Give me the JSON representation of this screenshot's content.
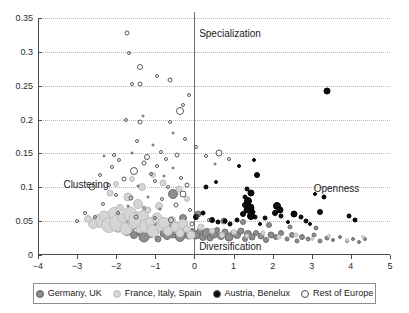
{
  "chart_data": {
    "type": "scatter",
    "title": "",
    "subtitle": "",
    "xlabel": "",
    "ylabel": "",
    "xlim": [
      -4,
      5
    ],
    "ylim": [
      0,
      0.35
    ],
    "grid": "horizontal-dotted",
    "legend_position": "bottom",
    "xticks": [
      "-4",
      "-3",
      "-2",
      "-1",
      "0",
      "1",
      "2",
      "3",
      "4",
      "5"
    ],
    "xtick_values": [
      -4,
      -3,
      -2,
      -1,
      0,
      1,
      2,
      3,
      4,
      5
    ],
    "yticks": [
      "0",
      "0.05",
      "0.1",
      "0.15",
      "0.2",
      "0.25",
      "0.3",
      "0.35"
    ],
    "ytick_values": [
      0,
      0.05,
      0.1,
      0.15,
      0.2,
      0.25,
      0.3,
      0.35
    ],
    "reference_lines": [
      {
        "axis": "x",
        "value": 0
      }
    ],
    "annotations": [
      {
        "text": "Specialization",
        "x": 0.12,
        "y": 0.335,
        "align": "left"
      },
      {
        "text": "Clustering",
        "x": -3.35,
        "y": 0.112,
        "align": "left"
      },
      {
        "text": "Openness",
        "x": 3.05,
        "y": 0.107,
        "align": "left"
      },
      {
        "text": "Diversification",
        "x": 0.12,
        "y": 0.021,
        "align": "left"
      }
    ],
    "legend": [
      {
        "name": "Germany, UK",
        "marker": "filled-circle",
        "color": "#8e8e8e"
      },
      {
        "name": "France, Italy, Spain",
        "marker": "filled-circle",
        "color": "#d5d5d5"
      },
      {
        "name": "Austria, Benelux",
        "marker": "filled-circle",
        "color": "#0d0d0d"
      },
      {
        "name": "Rest of Europe",
        "marker": "open-circle",
        "color": "#ffffff"
      }
    ],
    "series": [
      {
        "name": "Germany, UK",
        "key": "de",
        "color": "#8e8e8e",
        "points": [
          [
            -2.05,
            0.048,
            9
          ],
          [
            -1.95,
            0.041,
            11
          ],
          [
            -1.8,
            0.052,
            7
          ],
          [
            -1.72,
            0.036,
            10
          ],
          [
            -1.62,
            0.044,
            13
          ],
          [
            -1.55,
            0.03,
            8
          ],
          [
            -1.44,
            0.049,
            12
          ],
          [
            -1.36,
            0.034,
            9
          ],
          [
            -1.28,
            0.027,
            11
          ],
          [
            -1.18,
            0.042,
            14
          ],
          [
            -1.1,
            0.031,
            8
          ],
          [
            -1.02,
            0.038,
            10
          ],
          [
            -0.94,
            0.024,
            7
          ],
          [
            -0.86,
            0.045,
            12
          ],
          [
            -0.78,
            0.033,
            9
          ],
          [
            -0.7,
            0.028,
            8
          ],
          [
            -0.62,
            0.04,
            11
          ],
          [
            -0.54,
            0.03,
            7
          ],
          [
            -0.46,
            0.035,
            9
          ],
          [
            -0.38,
            0.026,
            10
          ],
          [
            -0.3,
            0.032,
            8
          ],
          [
            -0.22,
            0.038,
            7
          ],
          [
            -0.14,
            0.029,
            9
          ],
          [
            -0.06,
            0.034,
            8
          ],
          [
            0.05,
            0.03,
            9
          ],
          [
            0.14,
            0.036,
            7
          ],
          [
            0.22,
            0.027,
            8
          ],
          [
            0.31,
            0.033,
            10
          ],
          [
            0.4,
            0.025,
            7
          ],
          [
            0.49,
            0.031,
            9
          ],
          [
            0.58,
            0.037,
            6
          ],
          [
            0.67,
            0.028,
            8
          ],
          [
            0.78,
            0.034,
            7
          ],
          [
            0.88,
            0.026,
            9
          ],
          [
            0.98,
            0.032,
            6
          ],
          [
            1.08,
            0.029,
            8
          ],
          [
            1.18,
            0.035,
            7
          ],
          [
            1.28,
            0.024,
            6
          ],
          [
            1.38,
            0.031,
            8
          ],
          [
            1.48,
            0.027,
            7
          ],
          [
            1.58,
            0.033,
            6
          ],
          [
            1.7,
            0.028,
            7
          ],
          [
            1.82,
            0.022,
            6
          ],
          [
            1.95,
            0.03,
            7
          ],
          [
            2.08,
            0.026,
            6
          ],
          [
            2.22,
            0.033,
            6
          ],
          [
            2.36,
            0.024,
            5
          ],
          [
            2.5,
            0.029,
            6
          ],
          [
            2.62,
            0.021,
            5
          ],
          [
            2.76,
            0.027,
            6
          ],
          [
            2.9,
            0.023,
            5
          ],
          [
            3.05,
            0.029,
            5
          ],
          [
            3.2,
            0.02,
            5
          ],
          [
            3.38,
            0.025,
            5
          ],
          [
            3.55,
            0.022,
            4
          ],
          [
            3.72,
            0.027,
            4
          ],
          [
            3.9,
            0.021,
            4
          ],
          [
            4.05,
            0.024,
            4
          ],
          [
            4.2,
            0.019,
            4
          ],
          [
            4.35,
            0.023,
            4
          ],
          [
            -0.55,
            0.09,
            10
          ],
          [
            -0.3,
            0.054,
            8
          ],
          [
            0.1,
            0.061,
            7
          ],
          [
            0.75,
            0.05,
            7
          ],
          [
            1.25,
            0.048,
            6
          ],
          [
            1.9,
            0.045,
            6
          ],
          [
            2.45,
            0.042,
            5
          ],
          [
            3.1,
            0.04,
            5
          ]
        ]
      },
      {
        "name": "France, Italy, Spain",
        "key": "fr",
        "color": "#d5d5d5",
        "points": [
          [
            -2.45,
            0.05,
            14
          ],
          [
            -2.3,
            0.058,
            11
          ],
          [
            -2.18,
            0.044,
            16
          ],
          [
            -2.05,
            0.062,
            12
          ],
          [
            -1.95,
            0.047,
            18
          ],
          [
            -1.86,
            0.055,
            10
          ],
          [
            -1.76,
            0.039,
            13
          ],
          [
            -1.66,
            0.06,
            15
          ],
          [
            -1.58,
            0.046,
            11
          ],
          [
            -1.48,
            0.052,
            17
          ],
          [
            -1.4,
            0.038,
            9
          ],
          [
            -1.32,
            0.057,
            12
          ],
          [
            -1.24,
            0.043,
            14
          ],
          [
            -1.14,
            0.049,
            10
          ],
          [
            -1.06,
            0.035,
            13
          ],
          [
            -0.96,
            0.054,
            11
          ],
          [
            -0.88,
            0.041,
            9
          ],
          [
            -0.78,
            0.047,
            12
          ],
          [
            -0.68,
            0.036,
            10
          ],
          [
            -0.58,
            0.051,
            8
          ],
          [
            -0.48,
            0.042,
            11
          ],
          [
            -0.38,
            0.033,
            9
          ],
          [
            -0.28,
            0.046,
            10
          ],
          [
            -0.18,
            0.038,
            8
          ],
          [
            -0.08,
            0.03,
            9
          ],
          [
            -2.6,
            0.046,
            10
          ],
          [
            -2.72,
            0.053,
            8
          ],
          [
            -1.7,
            0.085,
            9
          ],
          [
            -1.9,
            0.07,
            8
          ],
          [
            -1.45,
            0.076,
            10
          ],
          [
            -1.2,
            0.066,
            7
          ],
          [
            -0.9,
            0.072,
            8
          ],
          [
            -2.15,
            0.092,
            7
          ],
          [
            -1.35,
            0.1,
            8
          ],
          [
            -0.8,
            0.106,
            7
          ],
          [
            -1.05,
            0.118,
            6
          ],
          [
            -1.6,
            0.112,
            6
          ],
          [
            -2.0,
            0.105,
            6
          ],
          [
            -0.4,
            0.097,
            7
          ],
          [
            -0.2,
            0.082,
            6
          ],
          [
            0.18,
            0.042,
            7
          ],
          [
            0.45,
            0.036,
            6
          ],
          [
            0.7,
            0.03,
            6
          ],
          [
            1.0,
            0.034,
            6
          ],
          [
            1.35,
            0.028,
            5
          ],
          [
            1.75,
            0.032,
            5
          ],
          [
            2.15,
            0.026,
            5
          ],
          [
            2.6,
            0.03,
            5
          ],
          [
            3.0,
            0.024,
            4
          ],
          [
            3.45,
            0.028,
            4
          ],
          [
            3.9,
            0.022,
            4
          ],
          [
            4.3,
            0.026,
            4
          ]
        ]
      },
      {
        "name": "Austria, Benelux",
        "key": "at",
        "color": "#0d0d0d",
        "points": [
          [
            3.4,
            0.242,
            7
          ],
          [
            1.6,
            0.118,
            6
          ],
          [
            1.35,
            0.098,
            5
          ],
          [
            1.45,
            0.092,
            7
          ],
          [
            1.3,
            0.086,
            5
          ],
          [
            1.38,
            0.08,
            8
          ],
          [
            1.28,
            0.074,
            6
          ],
          [
            1.42,
            0.07,
            9
          ],
          [
            1.34,
            0.066,
            7
          ],
          [
            1.5,
            0.064,
            5
          ],
          [
            1.24,
            0.06,
            6
          ],
          [
            1.44,
            0.058,
            8
          ],
          [
            1.56,
            0.056,
            5
          ],
          [
            2.1,
            0.072,
            8
          ],
          [
            2.18,
            0.066,
            7
          ],
          [
            2.05,
            0.062,
            6
          ],
          [
            2.22,
            0.058,
            5
          ],
          [
            3.2,
            0.064,
            6
          ],
          [
            3.3,
            0.086,
            5
          ],
          [
            3.08,
            0.09,
            4
          ],
          [
            2.55,
            0.06,
            7
          ],
          [
            2.72,
            0.056,
            5
          ],
          [
            2.86,
            0.05,
            5
          ],
          [
            3.95,
            0.058,
            5
          ],
          [
            4.1,
            0.052,
            5
          ],
          [
            0.45,
            0.052,
            6
          ],
          [
            0.6,
            0.048,
            5
          ],
          [
            0.78,
            0.05,
            5
          ],
          [
            0.92,
            0.046,
            5
          ],
          [
            1.08,
            0.052,
            5
          ],
          [
            1.68,
            0.046,
            4
          ],
          [
            1.8,
            0.055,
            5
          ],
          [
            0.3,
            0.1,
            5
          ],
          [
            0.55,
            0.108,
            4
          ],
          [
            2.4,
            0.048,
            4
          ],
          [
            2.95,
            0.046,
            4
          ],
          [
            1.15,
            0.132,
            4
          ],
          [
            1.52,
            0.14,
            4
          ],
          [
            0.22,
            0.062,
            5
          ],
          [
            0.05,
            0.056,
            6
          ]
        ]
      },
      {
        "name": "Rest of Europe",
        "key": "re",
        "color": "#ffffff",
        "points": [
          [
            -1.72,
            0.328,
            5
          ],
          [
            -1.68,
            0.298,
            4
          ],
          [
            -1.38,
            0.278,
            6
          ],
          [
            -1.4,
            0.252,
            5
          ],
          [
            -1.6,
            0.252,
            4
          ],
          [
            -0.95,
            0.264,
            4
          ],
          [
            -0.62,
            0.258,
            5
          ],
          [
            -1.75,
            0.2,
            4
          ],
          [
            -1.4,
            0.196,
            5
          ],
          [
            -1.32,
            0.205,
            3
          ],
          [
            -0.38,
            0.213,
            8
          ],
          [
            -0.3,
            0.222,
            4
          ],
          [
            -0.62,
            0.196,
            4
          ],
          [
            -0.55,
            0.18,
            3
          ],
          [
            -0.25,
            0.172,
            4
          ],
          [
            -1.48,
            0.168,
            4
          ],
          [
            -1.05,
            0.162,
            3
          ],
          [
            -0.86,
            0.152,
            4
          ],
          [
            -1.6,
            0.15,
            3
          ],
          [
            -2.05,
            0.148,
            4
          ],
          [
            -2.3,
            0.146,
            3
          ],
          [
            -1.22,
            0.144,
            6
          ],
          [
            -0.72,
            0.142,
            4
          ],
          [
            -0.45,
            0.148,
            5
          ],
          [
            -1.92,
            0.14,
            4
          ],
          [
            -1.3,
            0.136,
            5
          ],
          [
            -0.95,
            0.132,
            4
          ],
          [
            -0.55,
            0.128,
            3
          ],
          [
            -2.12,
            0.13,
            4
          ],
          [
            -1.55,
            0.124,
            8
          ],
          [
            -1.12,
            0.12,
            4
          ],
          [
            -0.78,
            0.116,
            3
          ],
          [
            -2.42,
            0.118,
            4
          ],
          [
            -1.8,
            0.112,
            5
          ],
          [
            -1.02,
            0.11,
            4
          ],
          [
            -0.35,
            0.114,
            4
          ],
          [
            -2.62,
            0.1,
            7
          ],
          [
            -2.18,
            0.104,
            4
          ],
          [
            -1.45,
            0.102,
            3
          ],
          [
            -0.68,
            0.1,
            4
          ],
          [
            -0.2,
            0.104,
            5
          ],
          [
            -2.0,
            0.088,
            4
          ],
          [
            -1.62,
            0.084,
            5
          ],
          [
            -1.18,
            0.086,
            3
          ],
          [
            -0.82,
            0.082,
            4
          ],
          [
            -0.3,
            0.09,
            7
          ],
          [
            -2.35,
            0.076,
            4
          ],
          [
            -1.7,
            0.072,
            3
          ],
          [
            -1.28,
            0.07,
            4
          ],
          [
            -0.88,
            0.068,
            3
          ],
          [
            -0.48,
            0.074,
            5
          ],
          [
            -0.12,
            0.066,
            4
          ],
          [
            -1.95,
            0.062,
            4
          ],
          [
            -1.5,
            0.056,
            5
          ],
          [
            -1.0,
            0.054,
            4
          ],
          [
            -0.6,
            0.052,
            6
          ],
          [
            0.1,
            0.058,
            4
          ],
          [
            0.38,
            0.052,
            4
          ],
          [
            -0.05,
            0.046,
            5
          ],
          [
            -2.55,
            0.056,
            4
          ],
          [
            0.62,
            0.15,
            7
          ],
          [
            0.3,
            0.146,
            4
          ],
          [
            -0.15,
            0.236,
            4
          ],
          [
            0.05,
            0.16,
            4
          ],
          [
            -2.8,
            0.062,
            4
          ],
          [
            -3.0,
            0.05,
            4
          ],
          [
            0.88,
            0.142,
            4
          ],
          [
            0.52,
            0.134,
            3
          ]
        ]
      }
    ]
  }
}
